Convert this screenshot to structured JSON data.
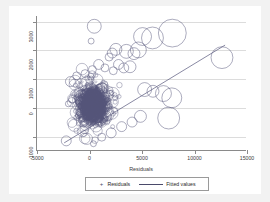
{
  "chart_data": {
    "type": "scatter",
    "title": "",
    "xlabel": "Residuals",
    "ylabel": "",
    "xlim": [
      -5000,
      15000
    ],
    "ylim": [
      -1500,
      3200
    ],
    "xticks": [
      -5000,
      0,
      5000,
      10000,
      15000
    ],
    "xticklabels": [
      "-5000",
      "0",
      "5000",
      "10000",
      "15000"
    ],
    "yticks": [
      -1000,
      0,
      1000,
      2000,
      3000
    ],
    "yticklabels": [
      "-1000",
      "0",
      "1000",
      "2000",
      "3000"
    ],
    "grid": "horizontal",
    "legend_position": "below-plot",
    "legend": [
      {
        "label": "Residuals",
        "marker": "open-circle",
        "glyph": "+"
      },
      {
        "label": "Fitted values",
        "marker": "line",
        "glyph": ""
      }
    ],
    "marker_style": "open-circle-variable-size",
    "series": [
      {
        "name": "Residuals",
        "marker_color": "#55557a",
        "points": [
          {
            "x": 480,
            "y": 2840,
            "r": 7
          },
          {
            "x": 180,
            "y": 2320,
            "r": 3
          },
          {
            "x": 5100,
            "y": 2480,
            "r": 9
          },
          {
            "x": 6050,
            "y": 2430,
            "r": 11
          },
          {
            "x": 7950,
            "y": 2600,
            "r": 14
          },
          {
            "x": 12700,
            "y": 1740,
            "r": 11
          },
          {
            "x": 4700,
            "y": 2010,
            "r": 8
          },
          {
            "x": 4280,
            "y": 1880,
            "r": 6
          },
          {
            "x": 3550,
            "y": 1960,
            "r": 7
          },
          {
            "x": 2550,
            "y": 2030,
            "r": 6
          },
          {
            "x": 2200,
            "y": 1900,
            "r": 5
          },
          {
            "x": 1900,
            "y": 1760,
            "r": 4
          },
          {
            "x": 3900,
            "y": 1420,
            "r": 6
          },
          {
            "x": 3300,
            "y": 1380,
            "r": 5
          },
          {
            "x": 2800,
            "y": 1500,
            "r": 5
          },
          {
            "x": 2300,
            "y": 1280,
            "r": 4
          },
          {
            "x": 1500,
            "y": 1380,
            "r": 4
          },
          {
            "x": 900,
            "y": 1500,
            "r": 5
          },
          {
            "x": 300,
            "y": 1320,
            "r": 4
          },
          {
            "x": -400,
            "y": 1180,
            "r": 4
          },
          {
            "x": -1200,
            "y": 1100,
            "r": 4
          },
          {
            "x": -1800,
            "y": 900,
            "r": 5
          },
          {
            "x": 5300,
            "y": 620,
            "r": 7
          },
          {
            "x": 6100,
            "y": 560,
            "r": 6
          },
          {
            "x": 7100,
            "y": 480,
            "r": 8
          },
          {
            "x": 7900,
            "y": 330,
            "r": 10
          },
          {
            "x": 7600,
            "y": -380,
            "r": 11
          },
          {
            "x": 4900,
            "y": -320,
            "r": 6
          },
          {
            "x": 4100,
            "y": -520,
            "r": 5
          },
          {
            "x": 3100,
            "y": -680,
            "r": 5
          },
          {
            "x": 2100,
            "y": -900,
            "r": 5
          },
          {
            "x": 1200,
            "y": -1050,
            "r": 4
          },
          {
            "x": 400,
            "y": -1280,
            "r": 3
          },
          {
            "x": -2200,
            "y": -1180,
            "r": 5
          },
          {
            "x": -1600,
            "y": 280,
            "r": 4
          },
          {
            "x": -2000,
            "y": 120,
            "r": 3
          }
        ],
        "cluster_center": {
          "x": 400,
          "y": 100
        },
        "cluster_note": "dense overlapping open circles centered near x=0, spanning roughly -2500 to 3500 on x and -1300 to 1700 on y"
      },
      {
        "name": "Fitted values",
        "type": "line",
        "color": "#55557a",
        "x": [
          -2400,
          13000
        ],
        "y": [
          -1250,
          2180
        ]
      }
    ]
  },
  "legend_box": {
    "residuals_label": "Residuals",
    "fitted_label": "Fitted values",
    "residuals_glyph": "+"
  },
  "axis": {
    "x_title": "Residuals"
  }
}
